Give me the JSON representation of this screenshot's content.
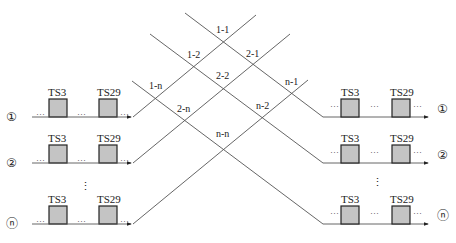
{
  "diagram": {
    "type": "time-slot cross-connect",
    "left_ports": [
      {
        "id": "①",
        "slots": [
          "TS3",
          "TS29"
        ],
        "y": 117
      },
      {
        "id": "②",
        "slots": [
          "TS3",
          "TS29"
        ],
        "y": 163
      },
      {
        "id": "ⓝ",
        "slots": [
          "TS3",
          "TS29"
        ],
        "y": 224
      }
    ],
    "right_ports": [
      {
        "id": "①",
        "slots": [
          "TS3",
          "TS29"
        ],
        "y": 117
      },
      {
        "id": "②",
        "slots": [
          "TS3",
          "TS29"
        ],
        "y": 163
      },
      {
        "id": "ⓝ",
        "slots": [
          "TS3",
          "TS29"
        ],
        "y": 224
      }
    ],
    "ellipsis": "···",
    "vertical_ellipsis": "⋮",
    "crossings": [
      {
        "label": "1-1",
        "x": 224,
        "y": 42
      },
      {
        "label": "1-2",
        "x": 196,
        "y": 66
      },
      {
        "label": "2-1",
        "x": 253,
        "y": 66
      },
      {
        "label": "1-n",
        "x": 156,
        "y": 98
      },
      {
        "label": "2-2",
        "x": 224,
        "y": 88
      },
      {
        "label": "n-1",
        "x": 294,
        "y": 94
      },
      {
        "label": "2-n",
        "x": 186,
        "y": 120
      },
      {
        "label": "n-2",
        "x": 264,
        "y": 118
      },
      {
        "label": "n-n",
        "x": 224,
        "y": 148
      }
    ]
  }
}
